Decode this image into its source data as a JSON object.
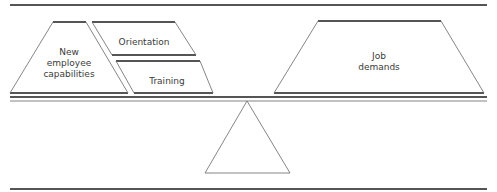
{
  "diagram": {
    "left_side": {
      "capabilities": {
        "line1": "New",
        "line2": "employee",
        "line3": "capabilities"
      },
      "orientation": {
        "label": "Orientation"
      },
      "training": {
        "label": "Training"
      }
    },
    "right_side": {
      "job_demands": {
        "line1": "Job",
        "line2": "demands"
      }
    },
    "fulcrum": {
      "shape": "triangle"
    },
    "colors": {
      "line": "#555555",
      "text": "#3a3a3a",
      "background": "#ffffff"
    }
  }
}
